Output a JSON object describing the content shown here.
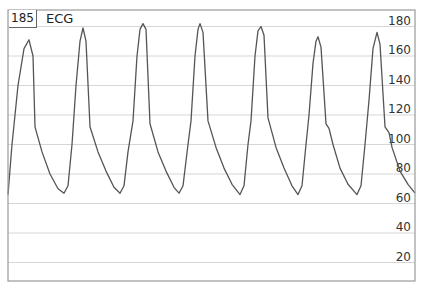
{
  "header": {
    "heart_rate": "185",
    "signal_label": "ECG"
  },
  "colors": {
    "trace": "#555555",
    "grid": "#d6d6d6",
    "frame": "#9a9a9a",
    "text": "#333333"
  },
  "chart_data": {
    "type": "line",
    "title": "ECG",
    "annotations": [
      "185"
    ],
    "xlabel": "",
    "ylabel": "",
    "ylim": [
      0,
      190
    ],
    "y_ticks": [
      20,
      40,
      60,
      80,
      100,
      120,
      140,
      160,
      180
    ],
    "y_tick_labels": [
      "20",
      "40",
      "60",
      "80",
      "100",
      "120",
      "140",
      "160",
      "180"
    ],
    "y_axis_position": "right",
    "grid": true,
    "legend": null,
    "series": [
      {
        "name": "ECG",
        "points_px_x_value": [
          [
            8,
            66
          ],
          [
            12,
            100
          ],
          [
            18,
            140
          ],
          [
            24,
            165
          ],
          [
            29,
            171
          ],
          [
            33,
            160
          ],
          [
            35,
            112
          ],
          [
            42,
            95
          ],
          [
            50,
            80
          ],
          [
            58,
            70
          ],
          [
            64,
            67
          ],
          [
            68,
            72
          ],
          [
            72,
            100
          ],
          [
            76,
            140
          ],
          [
            80,
            170
          ],
          [
            83,
            179
          ],
          [
            86,
            170
          ],
          [
            90,
            112
          ],
          [
            98,
            95
          ],
          [
            106,
            82
          ],
          [
            114,
            71
          ],
          [
            120,
            67
          ],
          [
            124,
            72
          ],
          [
            128,
            95
          ],
          [
            133,
            116
          ],
          [
            137,
            160
          ],
          [
            140,
            178
          ],
          [
            143,
            182
          ],
          [
            146,
            178
          ],
          [
            150,
            114
          ],
          [
            158,
            95
          ],
          [
            166,
            82
          ],
          [
            174,
            71
          ],
          [
            179,
            67
          ],
          [
            183,
            72
          ],
          [
            188,
            100
          ],
          [
            191,
            116
          ],
          [
            195,
            160
          ],
          [
            198,
            178
          ],
          [
            200,
            182
          ],
          [
            203,
            176
          ],
          [
            208,
            116
          ],
          [
            216,
            98
          ],
          [
            224,
            84
          ],
          [
            232,
            73
          ],
          [
            240,
            66
          ],
          [
            244,
            72
          ],
          [
            248,
            100
          ],
          [
            251,
            116
          ],
          [
            255,
            160
          ],
          [
            258,
            177
          ],
          [
            261,
            180
          ],
          [
            264,
            174
          ],
          [
            268,
            118
          ],
          [
            276,
            98
          ],
          [
            284,
            84
          ],
          [
            292,
            72
          ],
          [
            298,
            66
          ],
          [
            302,
            72
          ],
          [
            306,
            100
          ],
          [
            309,
            120
          ],
          [
            313,
            155
          ],
          [
            316,
            170
          ],
          [
            318,
            173
          ],
          [
            321,
            166
          ],
          [
            326,
            114
          ],
          [
            329,
            111
          ],
          [
            333,
            100
          ],
          [
            340,
            84
          ],
          [
            348,
            73
          ],
          [
            357,
            66
          ],
          [
            361,
            72
          ],
          [
            365,
            100
          ],
          [
            369,
            130
          ],
          [
            373,
            165
          ],
          [
            377,
            176
          ],
          [
            380,
            168
          ],
          [
            385,
            112
          ],
          [
            389,
            108
          ],
          [
            392,
            98
          ],
          [
            400,
            82
          ],
          [
            408,
            73
          ],
          [
            415,
            67
          ]
        ],
        "peaks": [
          171,
          179,
          182,
          182,
          180,
          173,
          176
        ],
        "troughs": [
          67,
          67,
          67,
          66,
          66,
          66
        ]
      }
    ]
  }
}
